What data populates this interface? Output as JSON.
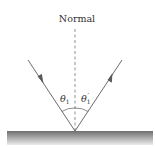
{
  "diagram": {
    "normal_label": "Normal",
    "incident_angle_label": "θ",
    "incident_angle_subscript": "1",
    "reflected_angle_label": "θ",
    "reflected_angle_subscript": "1",
    "reflected_angle_prime": "′",
    "colors": {
      "ray": "#5a5a5a",
      "surface_top": "#6e6e6e",
      "surface_bottom": "#e6e6e6",
      "normal": "#777777"
    }
  }
}
